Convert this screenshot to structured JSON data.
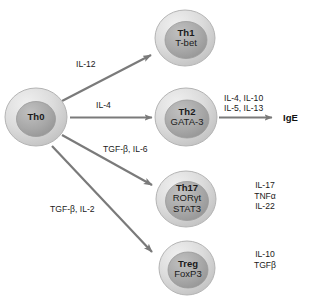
{
  "figure": {
    "background_color": "#ffffff",
    "cell_outer_color": "#d7d7d7",
    "cell_inner_color": "#a9a9a9",
    "arrow_color": "#7a7a7a",
    "text_color": "#1a1a1a"
  },
  "cells": [
    {
      "id": "th0",
      "name": "Th0",
      "factor": ""
    },
    {
      "id": "th1",
      "name": "Th1",
      "factor": "T-bet"
    },
    {
      "id": "th2",
      "name": "Th2",
      "factor": "GATA-3"
    },
    {
      "id": "th17",
      "name": "Th17",
      "factor": "RORγt",
      "factor2": "STAT3"
    },
    {
      "id": "treg",
      "name": "Treg",
      "factor": "FoxP3"
    }
  ],
  "edges": [
    {
      "id": "th0-th1",
      "label": "IL-12"
    },
    {
      "id": "th0-th2",
      "label": "IL-4"
    },
    {
      "id": "th0-th17",
      "label": "TGF-β, IL-6"
    },
    {
      "id": "th0-treg",
      "label": "TGF-β, IL-2"
    },
    {
      "id": "th2-ige",
      "label_line1": "IL-4, IL-10",
      "label_line2": "IL-5, IL-13"
    }
  ],
  "outputs": {
    "ige": "IgE",
    "th17": {
      "line1": "IL-17",
      "line2": "TNFα",
      "line3": "IL-22"
    },
    "treg": {
      "line1": "IL-10",
      "line2": "TGFβ"
    }
  }
}
